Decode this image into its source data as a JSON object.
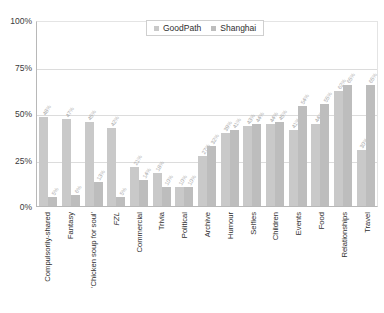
{
  "chart_data": {
    "type": "bar",
    "title": "",
    "xlabel": "",
    "ylabel": "",
    "ylim": [
      0,
      100
    ],
    "grid": true,
    "legend_position": "top-center",
    "yticks": [
      "0%",
      "25%",
      "50%",
      "75%",
      "100%"
    ],
    "categories": [
      "Compulsorily-shared",
      "Fantasy",
      "'Chicken soup for soul'",
      "FZL",
      "Commercial",
      "Trivia",
      "Political",
      "Archive",
      "Humour",
      "Selfies",
      "Children",
      "Events",
      "Food",
      "Relationships",
      "Travel"
    ],
    "categories_italic": [
      false,
      false,
      false,
      true,
      false,
      false,
      false,
      false,
      false,
      false,
      false,
      false,
      false,
      false,
      false
    ],
    "series": [
      {
        "name": "GoodPath",
        "color": "#c9c9c9",
        "values": [
          48,
          47,
          45,
          42,
          21,
          18,
          10,
          27,
          39,
          43,
          44,
          41,
          44,
          62,
          30
        ],
        "labels": [
          "48%",
          "47%",
          "45%",
          "42%",
          "21%",
          "18%",
          "10%",
          "27%",
          "39%",
          "43%",
          "44%",
          "41%",
          "44%",
          "62%",
          "30%"
        ]
      },
      {
        "name": "Shanghai",
        "color": "#bdbdbd",
        "values": [
          5,
          6,
          13,
          5,
          14,
          10,
          10,
          32,
          41,
          44,
          45,
          54,
          55,
          65,
          65
        ],
        "labels": [
          "5%",
          "6%",
          "13%",
          "5%",
          "14%",
          "10%",
          "10%",
          "32%",
          "41%",
          "44%",
          "45%",
          "54%",
          "55%",
          "65%",
          "65%"
        ]
      }
    ]
  },
  "legend": {
    "items": [
      {
        "label": "GoodPath"
      },
      {
        "label": "Shanghai"
      }
    ]
  }
}
